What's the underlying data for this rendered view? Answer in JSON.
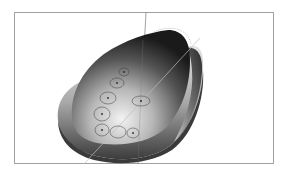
{
  "figure": {
    "kind": "3d-render",
    "frame": {
      "x": 14,
      "y": 12,
      "width": 260,
      "height": 152,
      "color": "#9a9a9a"
    },
    "axes": {
      "vertical": {
        "x_top": 146,
        "x_bottom": 138,
        "color": "#8a8a8a"
      },
      "diagonal": {
        "from": [
          84,
          164
        ],
        "to": [
          200,
          40
        ],
        "color": "#b0b0b0"
      }
    },
    "markers": [
      {
        "cx": 124,
        "cy": 72,
        "rx": 5,
        "ry": 4
      },
      {
        "cx": 117,
        "cy": 83,
        "rx": 7,
        "ry": 5
      },
      {
        "cx": 108,
        "cy": 98,
        "rx": 8,
        "ry": 6
      },
      {
        "cx": 141,
        "cy": 101,
        "rx": 9,
        "ry": 5
      },
      {
        "cx": 102,
        "cy": 114,
        "rx": 8,
        "ry": 7
      },
      {
        "cx": 102,
        "cy": 130,
        "rx": 7,
        "ry": 6
      },
      {
        "cx": 118,
        "cy": 132,
        "rx": 8,
        "ry": 6
      },
      {
        "cx": 133,
        "cy": 133,
        "rx": 6,
        "ry": 5
      }
    ],
    "colors": {
      "shell_dark": "#1e1e1e",
      "shell_mid": "#6a6a6a",
      "shell_light": "#e8e8e8",
      "base_light": "#d6d6d6",
      "base_dark": "#4a4a4a"
    }
  }
}
